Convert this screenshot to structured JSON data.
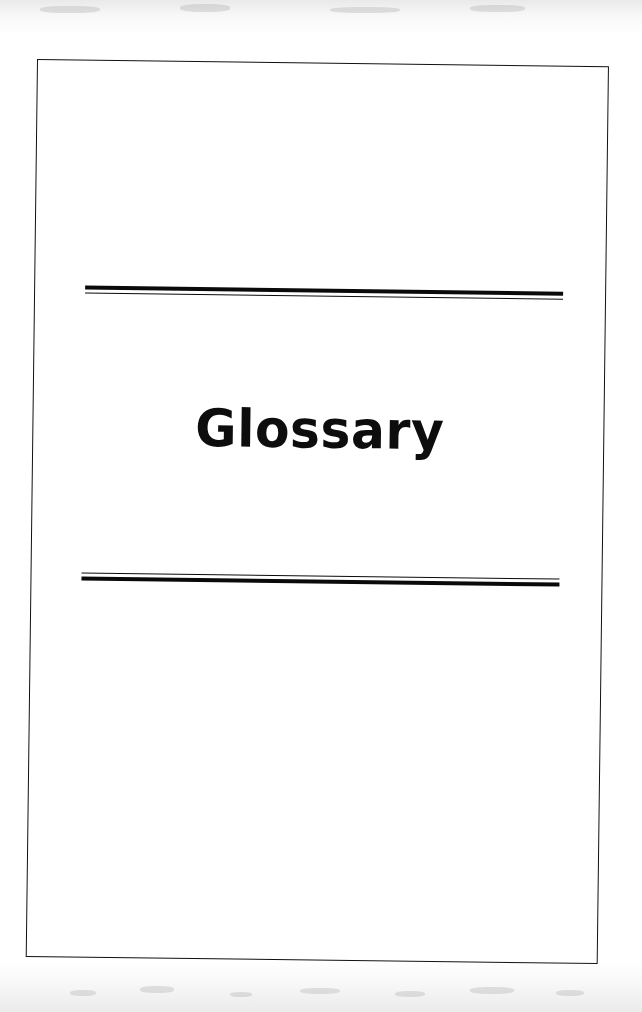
{
  "document": {
    "page_title": "Glossary",
    "page_kind": "section-divider-page",
    "background_color": "#ffffff",
    "ink_color": "#0d0d0d"
  },
  "page_frame": {
    "border_color": "#111111",
    "border_style": "thin solid rule box",
    "rotation_degrees": 0.72
  },
  "rules": {
    "top": {
      "style": "double rule: thick above, thin below",
      "color": "#0a0a0a",
      "thick_px": 4,
      "thin_px": 1.4
    },
    "bottom": {
      "style": "double rule: thin above, thick below",
      "color": "#0a0a0a",
      "thick_px": 4,
      "thin_px": 1.4
    }
  },
  "scan": {
    "noise_top_label": "scanner edge shadow",
    "noise_bottom_label": "scanner edge shadow"
  }
}
